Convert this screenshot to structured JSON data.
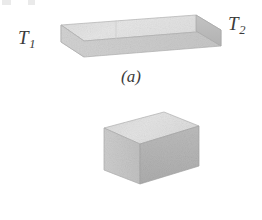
{
  "figure": {
    "background_color": "#ffffff",
    "width": 262,
    "height": 220,
    "ink_color": "#3b3b3b"
  },
  "scan_artifact": {
    "description": "cut-off-row-fragment",
    "color": "#d8d8d8"
  },
  "panels": [
    {
      "id": "a",
      "caption": "(a)",
      "shape": "rectangular-slab",
      "labels": {
        "left": {
          "symbol": "T",
          "subscript": "1"
        },
        "right": {
          "symbol": "T",
          "subscript": "2"
        }
      },
      "colors": {
        "top_face": "#e2e2e2",
        "front_face": "#cfcfcf",
        "right_face": "#b9b9b9",
        "edge": "#ababab"
      }
    },
    {
      "id": "b",
      "caption": "(b)",
      "shape": "cube",
      "labels": {
        "left": {
          "symbol": "T",
          "subscript": "1"
        },
        "right": {
          "symbol": "T",
          "subscript": "2"
        }
      },
      "colors": {
        "top_face": "#e0e0e0",
        "front_face": "#c9c9c9",
        "right_face": "#b4b4b4",
        "edge": "#a8a8a8"
      }
    }
  ]
}
